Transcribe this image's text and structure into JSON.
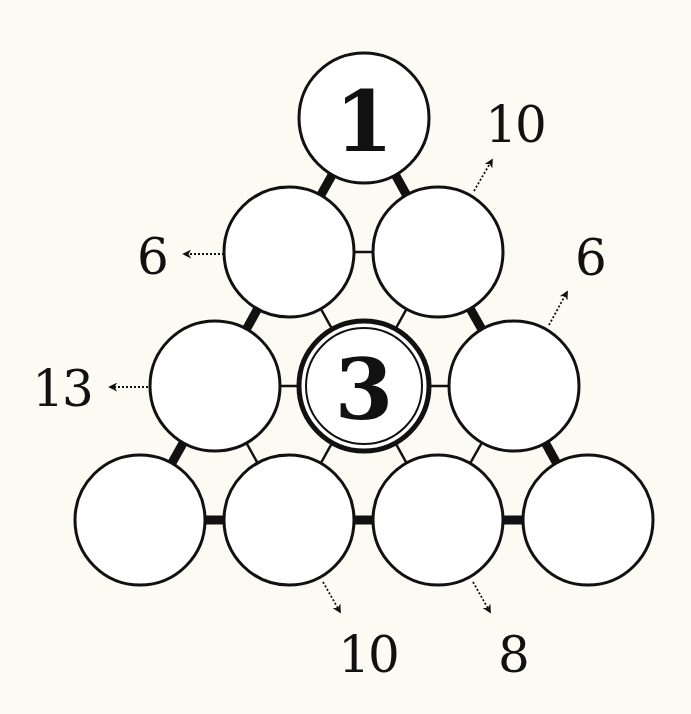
{
  "puzzle": {
    "type": "number-pyramid",
    "rows": 4,
    "colors": {
      "background": "#fbfaf3",
      "ink": "#111111",
      "cell_fill": "#ffffff"
    },
    "cells": [
      {
        "id": "r1c1",
        "row": 1,
        "col": 1,
        "cx": 364,
        "cy": 118,
        "value": "1",
        "given": true,
        "double_ring": false
      },
      {
        "id": "r2c1",
        "row": 2,
        "col": 1,
        "cx": 289,
        "cy": 252,
        "value": "",
        "given": false,
        "double_ring": false
      },
      {
        "id": "r2c2",
        "row": 2,
        "col": 2,
        "cx": 438,
        "cy": 252,
        "value": "",
        "given": false,
        "double_ring": false
      },
      {
        "id": "r3c1",
        "row": 3,
        "col": 1,
        "cx": 215,
        "cy": 386,
        "value": "",
        "given": false,
        "double_ring": false
      },
      {
        "id": "r3c2",
        "row": 3,
        "col": 2,
        "cx": 364,
        "cy": 386,
        "value": "3",
        "given": true,
        "double_ring": true
      },
      {
        "id": "r3c3",
        "row": 3,
        "col": 3,
        "cx": 514,
        "cy": 386,
        "value": "",
        "given": false,
        "double_ring": false
      },
      {
        "id": "r4c1",
        "row": 4,
        "col": 1,
        "cx": 140,
        "cy": 520,
        "value": "",
        "given": false,
        "double_ring": false
      },
      {
        "id": "r4c2",
        "row": 4,
        "col": 2,
        "cx": 289,
        "cy": 520,
        "value": "",
        "given": false,
        "double_ring": false
      },
      {
        "id": "r4c3",
        "row": 4,
        "col": 3,
        "cx": 438,
        "cy": 520,
        "value": "",
        "given": false,
        "double_ring": false
      },
      {
        "id": "r4c4",
        "row": 4,
        "col": 4,
        "cx": 588,
        "cy": 520,
        "value": "",
        "given": false,
        "double_ring": false
      }
    ],
    "connections": [
      {
        "from": "r1c1",
        "to": "r2c1",
        "style": "thick"
      },
      {
        "from": "r1c1",
        "to": "r2c2",
        "style": "thick"
      },
      {
        "from": "r2c1",
        "to": "r2c2",
        "style": "thin"
      },
      {
        "from": "r2c1",
        "to": "r3c1",
        "style": "thick"
      },
      {
        "from": "r2c1",
        "to": "r3c2",
        "style": "thin"
      },
      {
        "from": "r2c2",
        "to": "r3c2",
        "style": "thin"
      },
      {
        "from": "r2c2",
        "to": "r3c3",
        "style": "thick"
      },
      {
        "from": "r3c1",
        "to": "r3c2",
        "style": "thin"
      },
      {
        "from": "r3c2",
        "to": "r3c3",
        "style": "thin"
      },
      {
        "from": "r3c1",
        "to": "r4c1",
        "style": "thick"
      },
      {
        "from": "r3c1",
        "to": "r4c2",
        "style": "thin"
      },
      {
        "from": "r3c2",
        "to": "r4c2",
        "style": "thin"
      },
      {
        "from": "r3c2",
        "to": "r4c3",
        "style": "thin"
      },
      {
        "from": "r3c3",
        "to": "r4c3",
        "style": "thin"
      },
      {
        "from": "r3c3",
        "to": "r4c4",
        "style": "thick"
      },
      {
        "from": "r4c1",
        "to": "r4c2",
        "style": "thick"
      },
      {
        "from": "r4c2",
        "to": "r4c3",
        "style": "thick"
      },
      {
        "from": "r4c3",
        "to": "r4c4",
        "style": "thick"
      }
    ],
    "clues": [
      {
        "id": "clue-top-right",
        "text": "10",
        "x": 515,
        "y": 125,
        "arrow": {
          "x1": 474,
          "y1": 191,
          "x2": 492,
          "y2": 160
        }
      },
      {
        "id": "clue-left-row2",
        "text": "6",
        "x": 152,
        "y": 257,
        "arrow": {
          "x1": 224,
          "y1": 254,
          "x2": 184,
          "y2": 254
        }
      },
      {
        "id": "clue-right-row2",
        "text": "6",
        "x": 590,
        "y": 258,
        "arrow": {
          "x1": 549,
          "y1": 325,
          "x2": 567,
          "y2": 292
        }
      },
      {
        "id": "clue-left-row3",
        "text": "13",
        "x": 62,
        "y": 389,
        "arrow": {
          "x1": 148,
          "y1": 387,
          "x2": 110,
          "y2": 387
        }
      },
      {
        "id": "clue-bottom-col2",
        "text": "10",
        "x": 368,
        "y": 655,
        "arrow": {
          "x1": 323,
          "y1": 582,
          "x2": 340,
          "y2": 612
        }
      },
      {
        "id": "clue-bottom-col3",
        "text": "8",
        "x": 513,
        "y": 655,
        "arrow": {
          "x1": 473,
          "y1": 582,
          "x2": 490,
          "y2": 612
        }
      }
    ]
  }
}
